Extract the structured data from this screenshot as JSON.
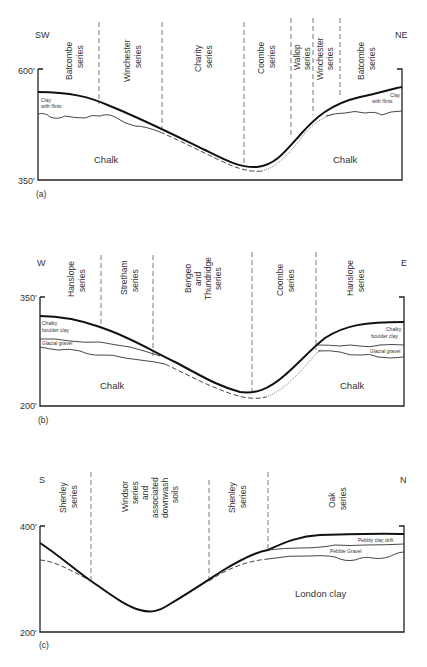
{
  "panels": [
    {
      "id": "a",
      "caption": "(a)",
      "left_direction": "SW",
      "right_direction": "NE",
      "top_elevation": "600'",
      "bottom_elevation": "350'",
      "series": [
        {
          "name": "Batcombe",
          "suffix": "series"
        },
        {
          "name": "Winchester",
          "suffix": "series"
        },
        {
          "name": "Charity",
          "suffix": "series"
        },
        {
          "name": "Coombe",
          "suffix": "series"
        },
        {
          "name": "Wallop",
          "suffix": "series"
        },
        {
          "name": "Winchester",
          "suffix": "series"
        },
        {
          "name": "Batcombe",
          "suffix": "series"
        }
      ],
      "left_layer_label": [
        "Clay",
        "with flints"
      ],
      "right_layer_label": [
        "Clay",
        "with flints"
      ],
      "bedrock": [
        "Chalk",
        "Chalk"
      ]
    },
    {
      "id": "b",
      "caption": "(b)",
      "left_direction": "W",
      "right_direction": "E",
      "top_elevation": "350'",
      "bottom_elevation": "200'",
      "series": [
        {
          "name": "Hanslope",
          "suffix": "series"
        },
        {
          "name": "Stretham",
          "suffix": "series"
        },
        {
          "name": "Bengeo and Thundridge",
          "lines": [
            "Bengeo",
            "and",
            "Thundridge"
          ],
          "suffix": "series"
        },
        {
          "name": "Coombe",
          "suffix": "series"
        },
        {
          "name": "Hanslope",
          "suffix": "series"
        }
      ],
      "left_layer_labels": [
        [
          "Chalky",
          "boulder clay"
        ],
        [
          "Glacial gravel"
        ]
      ],
      "right_layer_labels": [
        [
          "Chalky",
          "boulder clay"
        ],
        [
          "Glacial gravel"
        ]
      ],
      "bedrock": [
        "Chalk",
        "Chalk"
      ]
    },
    {
      "id": "c",
      "caption": "(c)",
      "left_direction": "S",
      "right_direction": "N",
      "top_elevation": "400'",
      "bottom_elevation": "200'",
      "series": [
        {
          "name": "Shenley",
          "suffix": "series"
        },
        {
          "name": "Windsor series and associated downwash soils",
          "lines": [
            "Windsor",
            "series",
            "and",
            "associated",
            "downwash",
            "soils"
          ]
        },
        {
          "name": "Shenley",
          "suffix": "series"
        },
        {
          "name": "Oak",
          "suffix": "series"
        }
      ],
      "right_layer_labels": [
        "Pebbly clay drift",
        "Pebble Gravel"
      ],
      "bedrock": [
        "London clay"
      ]
    }
  ]
}
